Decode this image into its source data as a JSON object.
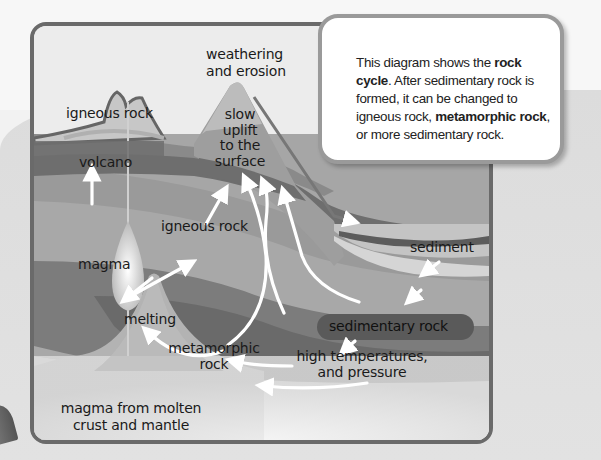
{
  "callout": {
    "segments": [
      {
        "text": "This diagram shows the ",
        "bold": false
      },
      {
        "text": "rock cycle",
        "bold": true
      },
      {
        "text": ". After sedimentary rock is formed, it can be changed to igneous rock, ",
        "bold": false
      },
      {
        "text": "metamorphic rock",
        "bold": true
      },
      {
        "text": ", or more sedimentary rock.",
        "bold": false
      }
    ]
  },
  "labels": {
    "weathering": "weathering",
    "erosion": "and erosion",
    "igneous_top": "igneous rock",
    "volcano": "volcano",
    "uplift_1": "slow",
    "uplift_2": "uplift",
    "uplift_3": "to the",
    "uplift_4": "surface",
    "igneous_mid": "igneous rock",
    "magma": "magma",
    "sediment": "sediment",
    "melting": "melting",
    "sedimentary_rock": "sedimentary rock",
    "metamorphic_1": "metamorphic",
    "metamorphic_2": "rock",
    "high_temp_1": "high temperatures,",
    "high_temp_2": "and pressure",
    "magma_source_1": "magma from molten",
    "magma_source_2": "crust and mantle"
  },
  "colors": {
    "frame": "#6a6a6a",
    "sky": "#ececec",
    "layer_dark": "#6e6e6e",
    "layer_mid": "#8a8a8a",
    "layer_light": "#a3a3a3",
    "arrow": "#ffffff"
  }
}
